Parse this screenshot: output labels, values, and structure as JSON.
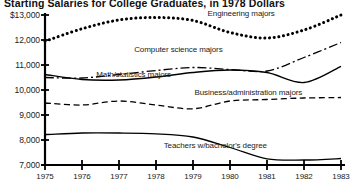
{
  "chart_data": {
    "type": "line",
    "title": "Starting Salaries for College Graduates, in 1978 Dollars",
    "xlabel": "",
    "ylabel": "",
    "x": [
      1975,
      1976,
      1977,
      1978,
      1979,
      1980,
      1981,
      1982,
      1983
    ],
    "xlim": [
      1975,
      1983
    ],
    "ylim": [
      7000,
      13000
    ],
    "ytick_labels": [
      "$13,000",
      "12,000",
      "11,000",
      "10,000",
      "9,000",
      "8,000",
      "7,000"
    ],
    "ytick_values": [
      13000,
      12000,
      11000,
      10000,
      9000,
      8000,
      7000
    ],
    "xtick_labels": [
      "1975",
      "1976",
      "1977",
      "1978",
      "1979",
      "1980",
      "1981",
      "1982",
      "1983"
    ],
    "grid": false,
    "legend_position": "inline-annotations",
    "series": [
      {
        "name": "Engineering majors",
        "style": "dotted",
        "label_x": 1980.3,
        "label_y": 13050,
        "values": [
          11950,
          12450,
          12800,
          12900,
          12780,
          12300,
          12080,
          12400,
          13000
        ]
      },
      {
        "name": "Computer science majors",
        "style": "dash-dot",
        "label_x": 1978.6,
        "label_y": 11600,
        "values": [
          10500,
          10480,
          10620,
          10780,
          10900,
          10820,
          10760,
          11300,
          11900
        ]
      },
      {
        "name": "Math/statistics majors",
        "style": "solid",
        "label_x": 1977.4,
        "label_y": 10600,
        "values": [
          10620,
          10420,
          10400,
          10520,
          10700,
          10800,
          10700,
          10300,
          10950
        ]
      },
      {
        "name": "Business/administration majors",
        "style": "dashed",
        "label_x": 1980.5,
        "label_y": 9900,
        "values": [
          9480,
          9400,
          9560,
          9400,
          9250,
          9560,
          9620,
          9680,
          9700
        ]
      },
      {
        "name": "Teachers w/bachelor's degree",
        "style": "solid",
        "label_x": 1979.6,
        "label_y": 7750,
        "values": [
          8220,
          8280,
          8280,
          8250,
          8120,
          7700,
          7250,
          7200,
          7260
        ]
      }
    ]
  }
}
